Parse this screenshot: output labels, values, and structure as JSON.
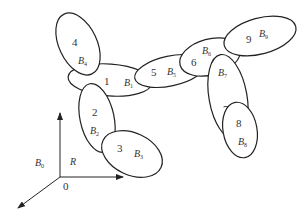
{
  "diagram": {
    "type": "multibody-system",
    "stroke_color": "#222222",
    "bodies": [
      {
        "id": "1",
        "label": "B",
        "sub": "1",
        "cx": 110,
        "cy": 80,
        "rx": 42,
        "ry": 16,
        "rot": 4,
        "nx": 104,
        "ny": 85,
        "lx": 124,
        "ly": 86
      },
      {
        "id": "2",
        "label": "B",
        "sub": "2",
        "cx": 97,
        "cy": 118,
        "rx": 17,
        "ry": 35,
        "rot": -12,
        "nx": 92,
        "ny": 116,
        "lx": 90,
        "ly": 134
      },
      {
        "id": "3",
        "label": "B",
        "sub": "3",
        "cx": 132,
        "cy": 154,
        "rx": 32,
        "ry": 21,
        "rot": 25,
        "nx": 117,
        "ny": 152,
        "lx": 134,
        "ly": 157
      },
      {
        "id": "4",
        "label": "B",
        "sub": "4",
        "cx": 78,
        "cy": 44,
        "rx": 19,
        "ry": 33,
        "rot": -25,
        "nx": 72,
        "ny": 46,
        "lx": 78,
        "ly": 64
      },
      {
        "id": "5",
        "label": "B",
        "sub": "5",
        "cx": 170,
        "cy": 71,
        "rx": 36,
        "ry": 15,
        "rot": -12,
        "nx": 151,
        "ny": 76,
        "lx": 167,
        "ly": 75
      },
      {
        "id": "6",
        "label": "B",
        "sub": "6",
        "cx": 210,
        "cy": 57,
        "rx": 31,
        "ry": 18,
        "rot": -15,
        "nx": 191,
        "ny": 66,
        "lx": 202,
        "ly": 54
      },
      {
        "id": "7",
        "label": "B",
        "sub": "7",
        "cx": 228,
        "cy": 97,
        "rx": 19,
        "ry": 43,
        "rot": -10,
        "nx": 223,
        "ny": 113,
        "lx": 218,
        "ly": 76
      },
      {
        "id": "8",
        "label": "B",
        "sub": "8",
        "cx": 240,
        "cy": 130,
        "rx": 17,
        "ry": 28,
        "rot": -10,
        "nx": 236,
        "ny": 127,
        "lx": 238,
        "ly": 145
      },
      {
        "id": "9",
        "label": "B",
        "sub": "9",
        "cx": 260,
        "cy": 36,
        "rx": 37,
        "ry": 18,
        "rot": -15,
        "nx": 246,
        "ny": 43,
        "lx": 259,
        "ly": 37
      }
    ],
    "reference_frame": {
      "origin_label": "0",
      "frame_label": "R",
      "base_label": "B",
      "base_sub": "0",
      "origin": {
        "x": 60,
        "y": 177
      },
      "y_axis_end": {
        "x": 60,
        "y": 113
      },
      "x_axis_end": {
        "x": 123,
        "y": 177
      },
      "z_axis_end": {
        "x": 18,
        "y": 208
      }
    }
  }
}
